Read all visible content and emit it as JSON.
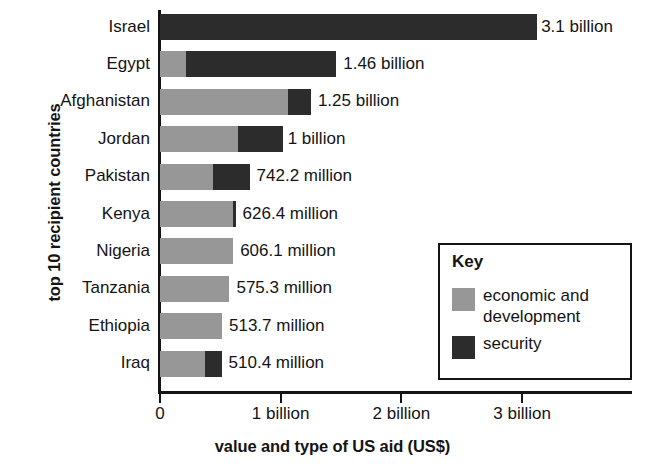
{
  "chart_data": {
    "type": "bar",
    "orientation": "horizontal",
    "stacked": true,
    "title": "",
    "xlabel": "value and type of US aid (US$)",
    "ylabel": "top 10 recipient countries",
    "xlim": [
      0,
      3.925
    ],
    "xtick_values": [
      0,
      1,
      2,
      3
    ],
    "xtick_labels": [
      "0",
      "1 billion",
      "2 billion",
      "3 billion"
    ],
    "grid": false,
    "categories": [
      "Israel",
      "Egypt",
      "Afghanistan",
      "Jordan",
      "Pakistan",
      "Kenya",
      "Nigeria",
      "Tanzania",
      "Ethiopia",
      "Iraq"
    ],
    "series": [
      {
        "name": "economic and development",
        "color": "#979797",
        "values": [
          0,
          0.215,
          1.06,
          0.645,
          0.44,
          0.601,
          0.6061,
          0.5753,
          0.5137,
          0.37
        ]
      },
      {
        "name": "security",
        "color": "#2c2c2c",
        "values": [
          3.12,
          1.245,
          0.19,
          0.375,
          0.3022,
          0.0254,
          0,
          0,
          0,
          0.14
        ]
      }
    ],
    "totals": [
      3.1,
      1.46,
      1.25,
      1.0,
      0.7422,
      0.6264,
      0.6061,
      0.5753,
      0.5137,
      0.5104
    ],
    "data_labels": [
      "3.1 billion",
      "1.46 billion",
      "1.25 billion",
      "1 billion",
      "742.2 million",
      "626.4 million",
      "606.1 million",
      "575.3 million",
      "513.7 million",
      "510.4 million"
    ],
    "legend": {
      "position": "inside-lower-right",
      "title": "Key",
      "entries": [
        {
          "label": "economic and development",
          "color": "#979797"
        },
        {
          "label": "security",
          "color": "#2c2c2c"
        }
      ]
    }
  },
  "legend_box": {
    "title": "Key",
    "entry_econ_line1": "economic and",
    "entry_econ_line2": "development",
    "entry_sec": "security"
  },
  "colors": {
    "economic": "#979797",
    "security": "#2c2c2c",
    "axis": "#141414",
    "background": "#ffffff"
  }
}
